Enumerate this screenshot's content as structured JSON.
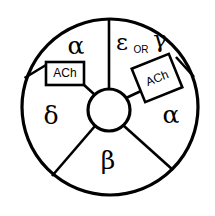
{
  "figure": {
    "name": "nicotinic-acetylcholine-receptor-cross-section",
    "geometry": {
      "outer_circle": {
        "cx": 110,
        "cy": 107,
        "r": 88
      },
      "inner_pore": {
        "cx": 109,
        "cy": 110,
        "r": 21
      }
    },
    "colors": {
      "stroke": "#000000",
      "fill": "#ffffff",
      "background": "#ffffff"
    }
  },
  "subunits": [
    {
      "id": "alpha-top-left",
      "label": "α",
      "name": "alpha",
      "x": 76,
      "y": 47
    },
    {
      "id": "epsilon-or-gamma",
      "label_primary": "ε",
      "label_conjunction": "OR",
      "label_secondary": "γ",
      "name": "epsilon-or-gamma",
      "primary_x": 122,
      "primary_y": 44,
      "conjunction_x": 141,
      "conjunction_y": 50,
      "secondary_x": 160,
      "secondary_y": 40
    },
    {
      "id": "alpha-right",
      "label": "α",
      "name": "alpha",
      "x": 171,
      "y": 116
    },
    {
      "id": "beta-bottom",
      "label": "β",
      "name": "beta",
      "x": 108,
      "y": 162
    },
    {
      "id": "delta-left",
      "label": "δ",
      "name": "delta",
      "x": 51,
      "y": 117
    }
  ],
  "binding_sites": [
    {
      "id": "ach-site-left",
      "label": "ACh",
      "name": "acetylcholine-binding-site-left",
      "cx": 64,
      "cy": 73,
      "width": 38,
      "height": 23,
      "rotation": 0
    },
    {
      "id": "ach-site-right",
      "label": "ACh",
      "name": "acetylcholine-binding-site-right",
      "cx": 157,
      "cy": 78,
      "width": 40,
      "height": 36,
      "rotation": -22
    }
  ],
  "dividers": [
    {
      "id": "divider-top",
      "x1": 109,
      "y1": 19,
      "x2": 109,
      "y2": 89,
      "name": "divider-alpha-epsilon"
    },
    {
      "id": "divider-upper-left",
      "x1": 46,
      "y1": 65,
      "x2": 25,
      "y2": 78,
      "name": "divider-alpha-delta-outer"
    },
    {
      "id": "divider-upper-left-inner",
      "x1": 46,
      "y1": 84,
      "x2": 92,
      "y2": 98,
      "name": "divider-alpha-delta-inner"
    },
    {
      "id": "divider-upper-right-outer",
      "x1": 176,
      "y1": 56,
      "x2": 196,
      "y2": 76,
      "name": "divider-gamma-alpha-outer"
    },
    {
      "id": "divider-upper-right-inner",
      "x1": 139,
      "y1": 90,
      "x2": 127,
      "y2": 97,
      "name": "divider-gamma-alpha-inner"
    },
    {
      "id": "divider-lower-left",
      "x1": 95,
      "y1": 126,
      "x2": 52,
      "y2": 176,
      "name": "divider-delta-beta"
    },
    {
      "id": "divider-lower-right",
      "x1": 124,
      "y1": 126,
      "x2": 173,
      "y2": 170,
      "name": "divider-beta-alpha"
    }
  ]
}
